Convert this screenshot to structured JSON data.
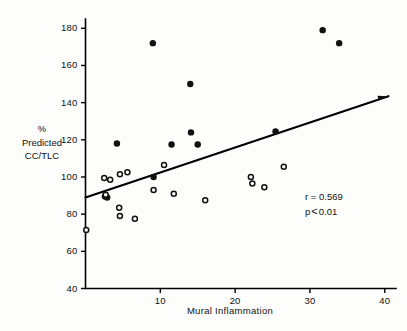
{
  "chart_data": {
    "type": "scatter",
    "title": "",
    "xlabel": "Mural Inflammation",
    "ylabel_lines": [
      "%",
      "Predicted",
      "CC/TLC"
    ],
    "ylabel": "% Predicted CC/TLC",
    "xlim": [
      0,
      41.5
    ],
    "ylim": [
      40,
      185
    ],
    "xticks": [
      10,
      20,
      30,
      40
    ],
    "yticks": [
      40,
      60,
      80,
      100,
      120,
      140,
      160,
      180
    ],
    "grid": false,
    "legend": null,
    "annotations": {
      "correlation_label": "r = 0.569",
      "correlation_value": 0.569,
      "pvalue_prefix": "p",
      "pvalue_operator": "<",
      "pvalue_label": "0.01"
    },
    "regression_line": {
      "x_start": 0,
      "y_start": 89,
      "x_end": 40.5,
      "y_end": 143.5,
      "color": "#111111"
    },
    "series": [
      {
        "name": "filled",
        "marker": "filled-circle",
        "color": "#111111",
        "points": [
          {
            "x": 2.6,
            "y": 89.5
          },
          {
            "x": 2.9,
            "y": 89.0
          },
          {
            "x": 4.2,
            "y": 118.0
          },
          {
            "x": 9.0,
            "y": 172.0
          },
          {
            "x": 9.1,
            "y": 100.0
          },
          {
            "x": 11.5,
            "y": 117.5
          },
          {
            "x": 14.0,
            "y": 150.0
          },
          {
            "x": 14.1,
            "y": 124.0
          },
          {
            "x": 15.0,
            "y": 117.5
          },
          {
            "x": 25.4,
            "y": 124.5
          },
          {
            "x": 31.7,
            "y": 179.0
          },
          {
            "x": 33.9,
            "y": 172.0
          }
        ]
      },
      {
        "name": "open",
        "marker": "open-circle",
        "color": "#111111",
        "points": [
          {
            "x": 0.1,
            "y": 71.5
          },
          {
            "x": 2.5,
            "y": 99.5
          },
          {
            "x": 3.3,
            "y": 98.5
          },
          {
            "x": 2.7,
            "y": 90.5
          },
          {
            "x": 4.6,
            "y": 101.5
          },
          {
            "x": 5.6,
            "y": 102.5
          },
          {
            "x": 4.5,
            "y": 83.5
          },
          {
            "x": 4.6,
            "y": 79.0
          },
          {
            "x": 6.6,
            "y": 77.5
          },
          {
            "x": 9.1,
            "y": 93.0
          },
          {
            "x": 10.5,
            "y": 106.5
          },
          {
            "x": 11.8,
            "y": 91.0
          },
          {
            "x": 16.0,
            "y": 87.5
          },
          {
            "x": 22.1,
            "y": 100.0
          },
          {
            "x": 22.3,
            "y": 96.5
          },
          {
            "x": 23.9,
            "y": 94.5
          },
          {
            "x": 26.5,
            "y": 105.5
          }
        ]
      }
    ]
  }
}
